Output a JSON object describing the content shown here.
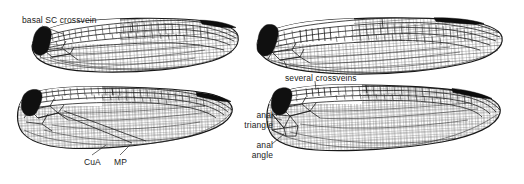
{
  "figure": {
    "kind": "scientific-line-drawing",
    "panel_count": 4,
    "panel_layout": "2 rows x 2 columns",
    "background_color": "#ffffff",
    "ink_color": "#1a1a1a",
    "panels": [
      {
        "id": "top-left",
        "name": "forewing-left-upper",
        "wing_type": "forewing",
        "orientation": "apex-right",
        "has_pterostigma": true,
        "has_dark_wing_base": true,
        "has_anal_triangle": false
      },
      {
        "id": "top-right",
        "name": "forewing-right-upper",
        "wing_type": "forewing",
        "orientation": "apex-right",
        "has_pterostigma": true,
        "has_dark_wing_base": true,
        "has_anal_triangle": false
      },
      {
        "id": "bottom-left",
        "name": "hindwing-left-lower",
        "wing_type": "hindwing",
        "orientation": "apex-right",
        "has_pterostigma": true,
        "has_dark_wing_base": true,
        "has_anal_triangle": false
      },
      {
        "id": "bottom-right",
        "name": "hindwing-right-lower",
        "wing_type": "hindwing",
        "orientation": "apex-right",
        "has_pterostigma": true,
        "has_dark_wing_base": true,
        "has_anal_triangle": true
      }
    ]
  },
  "annotations": {
    "basal_sc_crossvein": "basal SC crossvein",
    "several_crossveins": "several crossveins",
    "anal_triangle_line1": "anal",
    "anal_triangle_line2": "triangle",
    "anal_angle_line1": "anal",
    "anal_angle_line2": "angle",
    "cua": "CuA",
    "mp": "MP"
  }
}
